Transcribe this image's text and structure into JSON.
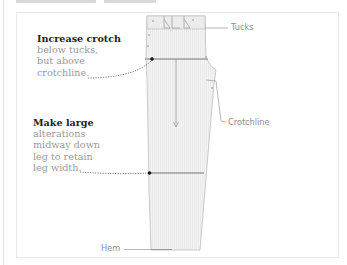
{
  "header": {
    "title_visible": false
  },
  "notes": [
    {
      "title": "Increase crotch",
      "lines": [
        "below tucks,",
        "but above",
        "crotchline."
      ]
    },
    {
      "title": "Make large",
      "lines": [
        "alterations",
        "midway down",
        "leg to retain",
        "leg width."
      ]
    }
  ],
  "labels": {
    "tucks": "Tucks",
    "crotchline": "Crotchline",
    "hem": "Hem"
  },
  "colors": {
    "pattern_fill": "#f1f1f1",
    "pattern_stroke": "#b9b9b9",
    "alteration_line": "#9e9e9e",
    "marker_dot": "#111111",
    "text_body": "#9a9a9a",
    "text_title": "#222222"
  }
}
